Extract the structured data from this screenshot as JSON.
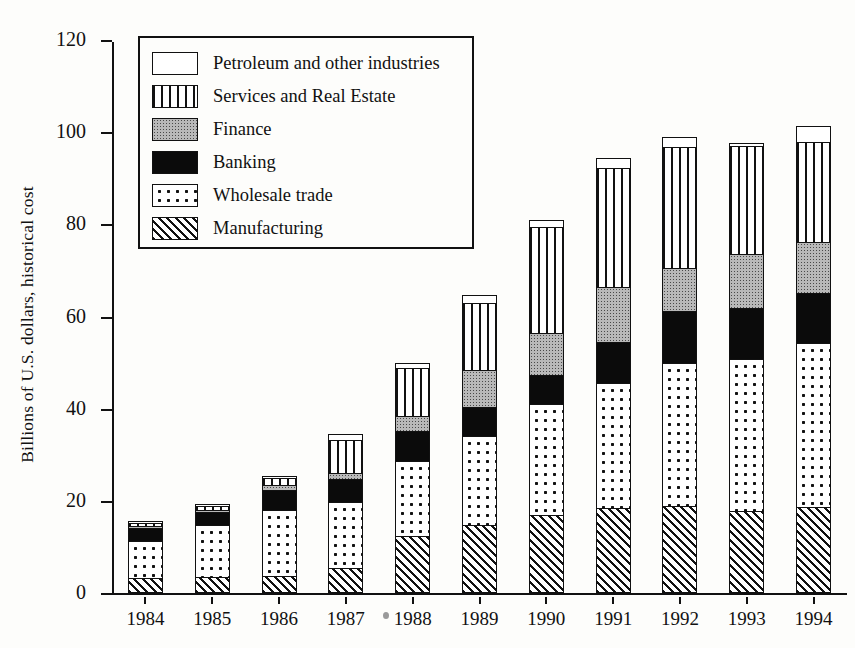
{
  "chart_data": {
    "type": "bar",
    "subtype": "stacked-vertical",
    "title": "",
    "xlabel": "",
    "ylabel": "Billions of U.S. dollars, historical cost",
    "ylim": [
      0,
      120
    ],
    "yticks": [
      0,
      20,
      40,
      60,
      80,
      100,
      120
    ],
    "ytick_labels": [
      "0",
      "20",
      "40",
      "60",
      "80",
      "100",
      "120"
    ],
    "grid": false,
    "legend_position": "upper-left-inside",
    "categories": [
      "1984",
      "1985",
      "1986",
      "1987",
      "1988",
      "1989",
      "1990",
      "1991",
      "1992",
      "1993",
      "1994"
    ],
    "series": [
      {
        "name": "Manufacturing",
        "pattern": "diagonal-hatch",
        "values": [
          3.3,
          3.5,
          3.8,
          5.5,
          12.3,
          14.7,
          17.0,
          18.4,
          18.8,
          17.8,
          18.7
        ]
      },
      {
        "name": "Wholesale trade",
        "pattern": "dots",
        "values": [
          8.1,
          11.5,
          14.4,
          14.4,
          16.5,
          19.5,
          24.2,
          27.3,
          31.4,
          33.1,
          35.7
        ]
      },
      {
        "name": "Banking",
        "pattern": "solid-black",
        "values": [
          3.1,
          3.1,
          4.5,
          5.2,
          6.9,
          6.5,
          6.5,
          9.3,
          11.5,
          11.3,
          11.1
        ]
      },
      {
        "name": "Finance",
        "pattern": "gray-stipple",
        "values": [
          0.4,
          0.4,
          1.3,
          1.5,
          3.3,
          8.3,
          9.4,
          12.0,
          9.4,
          12.1,
          11.4
        ]
      },
      {
        "name": "Services and Real Estate",
        "pattern": "vertical-stripes",
        "values": [
          0.9,
          0.9,
          1.8,
          7.4,
          10.8,
          14.7,
          23.2,
          26.0,
          26.5,
          23.5,
          21.8
        ]
      },
      {
        "name": "Petroleum and other industries",
        "pattern": "white-open",
        "values": [
          0.2,
          0.5,
          0.6,
          1.6,
          1.2,
          2.0,
          1.7,
          2.4,
          2.4,
          0.9,
          3.8
        ]
      }
    ],
    "totals": [
      16.0,
      19.0,
      26.4,
      35.6,
      51.0,
      65.7,
      82.0,
      95.4,
      100.0,
      98.7,
      102.5
    ]
  },
  "legend": {
    "items": [
      {
        "label": "Petroleum and other industries",
        "pattern": "white-open",
        "icon": "legend-swatch-icon"
      },
      {
        "label": "Services and Real Estate",
        "pattern": "vertical-stripes",
        "icon": "legend-swatch-icon"
      },
      {
        "label": "Finance",
        "pattern": "gray-stipple",
        "icon": "legend-swatch-icon"
      },
      {
        "label": "Banking",
        "pattern": "solid-black",
        "icon": "legend-swatch-icon"
      },
      {
        "label": "Wholesale trade",
        "pattern": "dots",
        "icon": "legend-swatch-icon"
      },
      {
        "label": "Manufacturing",
        "pattern": "diagonal-hatch",
        "icon": "legend-swatch-icon"
      }
    ]
  },
  "colors": {
    "ink": "#111111",
    "paper": "#fdfdfb",
    "finance_fill": "#b9b9b9",
    "banking_fill": "#0b0b0b"
  }
}
